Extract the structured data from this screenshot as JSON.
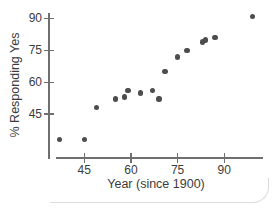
{
  "chart_data": {
    "type": "scatter",
    "title": "",
    "xlabel": "Year (since 1900)",
    "ylabel": "% Responding Yes",
    "x": [
      37,
      45,
      49,
      55,
      58,
      59,
      63,
      67,
      69,
      71,
      75,
      78,
      83,
      84,
      87,
      99
    ],
    "y": [
      33,
      33,
      48,
      52,
      53,
      56,
      55,
      56,
      52,
      65,
      72,
      75,
      79,
      80,
      81,
      91
    ],
    "x_tick_labels": [
      "45",
      "60",
      "75",
      "90"
    ],
    "x_tick_values": [
      45,
      60,
      75,
      90
    ],
    "y_tick_labels": [
      "45",
      "60",
      "75",
      "90"
    ],
    "y_tick_values": [
      45,
      60,
      75,
      90
    ],
    "xlim": [
      36,
      102
    ],
    "ylim": [
      24,
      92
    ],
    "grid": false,
    "legend": null
  },
  "colors": {
    "point": "#4d4d4d",
    "axis": "#6f6f6f",
    "text": "#3c3c3c",
    "frame": "#dcdcdc",
    "background": "#ffffff"
  }
}
